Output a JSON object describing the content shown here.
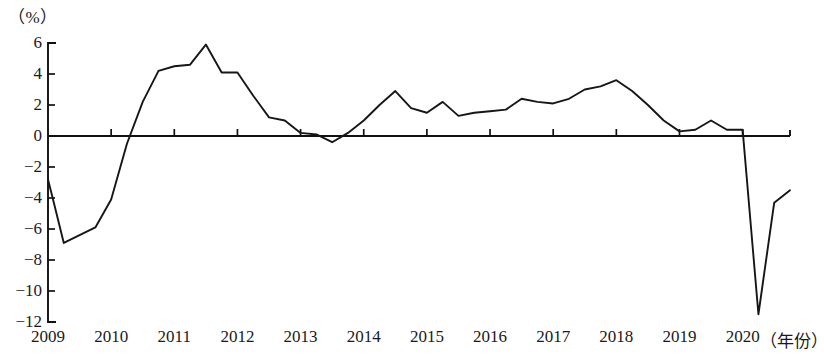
{
  "chart_data": {
    "type": "line",
    "title": "",
    "subtitle": "",
    "unit_label": "（%）",
    "ylabel": "（%）",
    "xlabel": "（年份）",
    "ylim": [
      -12,
      6
    ],
    "xlim": [
      2009,
      2020.75
    ],
    "grid": false,
    "legend": null,
    "y_ticks": [
      6,
      4,
      2,
      0,
      -2,
      -4,
      -6,
      -8,
      -10,
      -12
    ],
    "y_tick_labels": [
      "6",
      "4",
      "2",
      "0",
      "−2",
      "−4",
      "−6",
      "−8",
      "−10",
      "−12"
    ],
    "x_ticks": [
      2009,
      2010,
      2011,
      2012,
      2013,
      2014,
      2015,
      2016,
      2017,
      2018,
      2019,
      2020
    ],
    "x_tick_labels": [
      "2009",
      "2010",
      "2011",
      "2012",
      "2013",
      "2014",
      "2015",
      "2016",
      "2017",
      "2018",
      "2019",
      "2020"
    ],
    "series": [
      {
        "name": "growth_rate",
        "color": "#161616",
        "x": [
          2009.0,
          2009.08,
          2009.25,
          2009.5,
          2009.75,
          2010.0,
          2010.25,
          2010.5,
          2010.75,
          2011.0,
          2011.25,
          2011.5,
          2011.75,
          2012.0,
          2012.25,
          2012.5,
          2012.75,
          2013.0,
          2013.25,
          2013.5,
          2013.75,
          2014.0,
          2014.25,
          2014.5,
          2014.75,
          2015.0,
          2015.25,
          2015.5,
          2015.75,
          2016.0,
          2016.25,
          2016.5,
          2016.75,
          2017.0,
          2017.25,
          2017.5,
          2017.75,
          2018.0,
          2018.25,
          2018.5,
          2018.75,
          2019.0,
          2019.25,
          2019.5,
          2019.75,
          2020.0,
          2020.25,
          2020.5,
          2020.75
        ],
        "values": [
          -2.8,
          -4.1,
          -6.9,
          -6.4,
          -5.9,
          -4.1,
          -0.5,
          2.2,
          4.2,
          4.5,
          4.6,
          5.9,
          4.1,
          4.1,
          2.6,
          1.2,
          1.0,
          0.2,
          0.1,
          -0.4,
          0.2,
          1.0,
          2.0,
          2.9,
          1.8,
          1.5,
          2.2,
          1.3,
          1.5,
          1.6,
          1.7,
          2.4,
          2.2,
          2.1,
          2.4,
          3.0,
          3.2,
          3.6,
          2.9,
          2.0,
          1.0,
          0.3,
          0.4,
          1.0,
          0.4,
          0.4,
          -11.5,
          -4.3,
          -3.5
        ]
      }
    ],
    "annotations": []
  }
}
